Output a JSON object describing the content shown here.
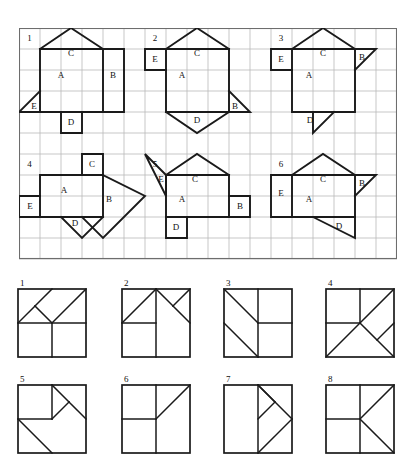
{
  "page": {
    "background_color": "#ffffff",
    "line_color": "#1a1a1a",
    "grid_color": "#b9b9b9",
    "grid_border_color": "#6d6d6d"
  },
  "grid": {
    "columns": 18,
    "rows": 11,
    "cell_size": 21,
    "description": "Light square grid containing six labelled nets"
  },
  "patterns": [
    {
      "number": "1",
      "labels": [
        {
          "name": "A",
          "text": "A"
        },
        {
          "name": "B",
          "text": "B"
        },
        {
          "name": "C",
          "text": "C"
        },
        {
          "name": "D",
          "text": "D"
        },
        {
          "name": "E",
          "text": "E"
        }
      ]
    },
    {
      "number": "2",
      "labels": [
        {
          "name": "A",
          "text": "A"
        },
        {
          "name": "B",
          "text": "B"
        },
        {
          "name": "C",
          "text": "C"
        },
        {
          "name": "D",
          "text": "D"
        },
        {
          "name": "E",
          "text": "E"
        }
      ]
    },
    {
      "number": "3",
      "labels": [
        {
          "name": "A",
          "text": "A"
        },
        {
          "name": "B",
          "text": "B"
        },
        {
          "name": "C",
          "text": "C"
        },
        {
          "name": "D",
          "text": "D"
        },
        {
          "name": "E",
          "text": "E"
        }
      ]
    },
    {
      "number": "4",
      "labels": [
        {
          "name": "A",
          "text": "A"
        },
        {
          "name": "B",
          "text": "B"
        },
        {
          "name": "C",
          "text": "C"
        },
        {
          "name": "D",
          "text": "D"
        },
        {
          "name": "E",
          "text": "E"
        }
      ]
    },
    {
      "number": "5",
      "labels": [
        {
          "name": "A",
          "text": "A"
        },
        {
          "name": "B",
          "text": "B"
        },
        {
          "name": "C",
          "text": "C"
        },
        {
          "name": "D",
          "text": "D"
        },
        {
          "name": "E",
          "text": "E"
        }
      ]
    },
    {
      "number": "6",
      "labels": [
        {
          "name": "A",
          "text": "A"
        },
        {
          "name": "B",
          "text": "B"
        },
        {
          "name": "C",
          "text": "C"
        },
        {
          "name": "D",
          "text": "D"
        },
        {
          "name": "E",
          "text": "E"
        }
      ]
    }
  ],
  "options": [
    {
      "number": "1"
    },
    {
      "number": "2"
    },
    {
      "number": "3"
    },
    {
      "number": "4"
    },
    {
      "number": "5"
    },
    {
      "number": "6"
    },
    {
      "number": "7"
    },
    {
      "number": "8"
    }
  ]
}
